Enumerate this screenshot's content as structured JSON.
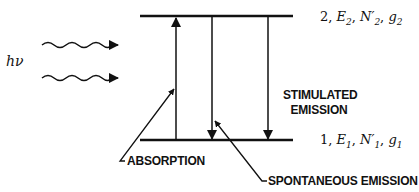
{
  "diagram": {
    "photon_label": "hν",
    "upper_level": {
      "index": "2",
      "energy": "E",
      "energy_sub": "2",
      "population": "N",
      "population_sub": "2",
      "degeneracy": "g",
      "degeneracy_sub": "2",
      "separator": ", "
    },
    "lower_level": {
      "index": "1",
      "energy": "E",
      "energy_sub": "1",
      "population": "N",
      "population_sub": "1",
      "degeneracy": "g",
      "degeneracy_sub": "1",
      "separator": ", "
    },
    "prime": "′",
    "labels": {
      "absorption": "ABSORPTION",
      "spontaneous_emission": "SPONTANEOUS EMISSION",
      "stimulated_line1": "STIMULATED",
      "stimulated_line2": "EMISSION"
    },
    "colors": {
      "ink": "#111111",
      "background": "#ffffff"
    }
  }
}
